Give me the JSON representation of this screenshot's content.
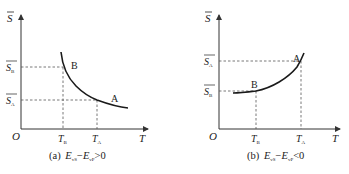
{
  "figure": {
    "panels": [
      {
        "id": "a",
        "caption_prefix": "(a)",
        "caption_expr_E1": "E",
        "caption_expr_E1_sub": "vS",
        "caption_expr_op": "−",
        "caption_expr_E2": "E",
        "caption_expr_E2_sub": "vP",
        "caption_expr_rel": ">0",
        "y_axis_label": "S",
        "x_axis_label": "T",
        "origin_label": "O",
        "y_ticks": [
          {
            "base": "S",
            "sub": "B"
          },
          {
            "base": "S",
            "sub": "A"
          }
        ],
        "x_ticks": [
          {
            "base": "T",
            "sub": "B"
          },
          {
            "base": "T",
            "sub": "A"
          }
        ],
        "point_labels": [
          "B",
          "A"
        ],
        "curve": "decreasing"
      },
      {
        "id": "b",
        "caption_prefix": "(b)",
        "caption_expr_E1": "E",
        "caption_expr_E1_sub": "vS",
        "caption_expr_op": "−",
        "caption_expr_E2": "E",
        "caption_expr_E2_sub": "vP",
        "caption_expr_rel": "<0",
        "y_axis_label": "S",
        "x_axis_label": "T",
        "origin_label": "O",
        "y_ticks": [
          {
            "base": "S",
            "sub": "A"
          },
          {
            "base": "S",
            "sub": "B"
          }
        ],
        "x_ticks": [
          {
            "base": "T",
            "sub": "B"
          },
          {
            "base": "T",
            "sub": "A"
          }
        ],
        "point_labels": [
          "A",
          "B"
        ],
        "curve": "increasing"
      }
    ],
    "colors": {
      "curve": "#1a1a1a",
      "axis": "#333333",
      "dashed": "#555555"
    }
  }
}
